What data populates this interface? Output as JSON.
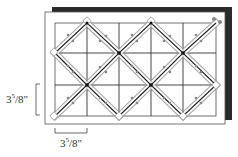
{
  "diagram": {
    "grid": {
      "x0": 55,
      "y0": 23,
      "cols": 5,
      "rows": 3,
      "cell_w": 32.2,
      "cell_h": 31
    },
    "colors": {
      "shadow": "#2a2a2a",
      "board": "#ffffff",
      "board_border": "#555555",
      "grid_line": "#333333",
      "strip_outline": "#999999",
      "strip_center": "#222222",
      "node": "#111111",
      "pins": "#888888"
    },
    "dimension_labels": {
      "vertical": {
        "whole": "3",
        "num": "5",
        "den": "8",
        "unit": "\""
      },
      "horizontal": {
        "whole": "3",
        "num": "5",
        "den": "8",
        "unit": "\""
      }
    },
    "vertical_label_text": "3⁵/₈\"",
    "horizontal_label_text": "3⁵/₈\""
  }
}
